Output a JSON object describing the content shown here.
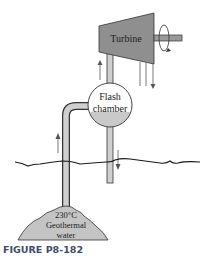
{
  "figure": {
    "caption": "FIGURE P8-182",
    "caption_color": "#3d4a6b"
  },
  "components": {
    "turbine": {
      "label": "Turbine",
      "fill": "#8f8f8f"
    },
    "flash_chamber": {
      "label_line1": "Flash",
      "label_line2": "chamber",
      "liquid_fill": "#c9c9c9"
    },
    "geothermal_source": {
      "label_line1": "230°C",
      "label_line2": "Geothermal",
      "label_line3": "water",
      "fill": "#c4c4c4"
    }
  },
  "pipe_color": "#cfcfcf",
  "outline_color": "#333333"
}
